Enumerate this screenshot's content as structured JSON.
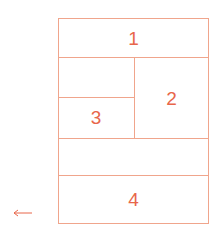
{
  "diagram": {
    "stroke_color": "#f0a58c",
    "text_color": "#e8664a",
    "regions": [
      {
        "id": "1",
        "label": "1"
      },
      {
        "id": "2",
        "label": "2"
      },
      {
        "id": "3",
        "label": "3"
      },
      {
        "id": "4",
        "label": "4"
      }
    ],
    "arrow": {
      "direction": "left",
      "icon": "arrow-left-icon"
    }
  }
}
